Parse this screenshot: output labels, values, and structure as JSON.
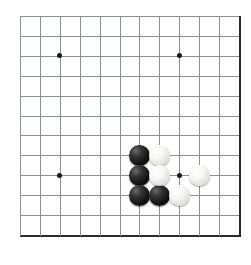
{
  "board": {
    "title": "Go board position",
    "game": "Go (Weiqi / Baduk)",
    "board_style": "grid-corner-view",
    "colors": {
      "background": "#ffffff",
      "grid_line": "#8c8f93",
      "board_edge": "#2b2b2b",
      "black_stone": "#111111",
      "white_stone": "#f4f4f2",
      "star_point": "#1a1a1a"
    },
    "geometry": {
      "origin_x": 20,
      "origin_y": 16,
      "spacing": 19.9,
      "columns": 12,
      "rows": 12,
      "stone_diameter": 21,
      "edge_right_column": 11,
      "edge_bottom_row": 11
    },
    "grid_labels": {
      "columns": [
        "0",
        "1",
        "2",
        "3",
        "4",
        "5",
        "6",
        "7",
        "8",
        "9",
        "10",
        "11"
      ],
      "rows": [
        "0",
        "1",
        "2",
        "3",
        "4",
        "5",
        "6",
        "7",
        "8",
        "9",
        "10",
        "11"
      ]
    },
    "star_points": [
      {
        "name": "hoshi-upper-left",
        "col": 2,
        "row": 2
      },
      {
        "name": "hoshi-upper-right",
        "col": 8,
        "row": 2
      },
      {
        "name": "hoshi-lower-left",
        "col": 2,
        "row": 8
      },
      {
        "name": "hoshi-lower-right",
        "col": 8,
        "row": 8
      }
    ],
    "stones": [
      {
        "id": "b1",
        "color": "black",
        "col": 6,
        "row": 7
      },
      {
        "id": "b2",
        "color": "black",
        "col": 6,
        "row": 8
      },
      {
        "id": "b3",
        "color": "black",
        "col": 6,
        "row": 9
      },
      {
        "id": "b4",
        "color": "black",
        "col": 7,
        "row": 9
      },
      {
        "id": "w1",
        "color": "white",
        "col": 7,
        "row": 7
      },
      {
        "id": "w2",
        "color": "white",
        "col": 7,
        "row": 8
      },
      {
        "id": "w3",
        "color": "white",
        "col": 8,
        "row": 9
      },
      {
        "id": "w4",
        "color": "white",
        "col": 9,
        "row": 8
      }
    ],
    "stone_counts": {
      "black": 4,
      "white": 4,
      "total": 8
    }
  }
}
